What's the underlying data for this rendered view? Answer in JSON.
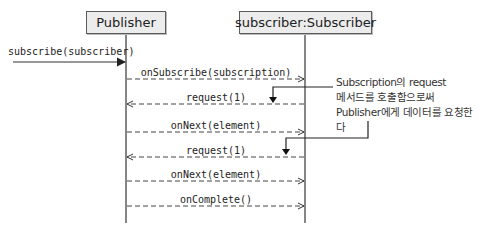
{
  "diagram": {
    "type": "sequence",
    "participants": [
      {
        "name": "Publisher",
        "lifeline_x": 126
      },
      {
        "name": "subscriber:Subscriber",
        "lifeline_x": 305
      }
    ],
    "messages": [
      {
        "label": "subscribe(subscriber)",
        "from": "external",
        "to": "Publisher",
        "style": "solid"
      },
      {
        "label": "onSubscribe(subscription)",
        "from": "Publisher",
        "to": "subscriber:Subscriber",
        "style": "dashed"
      },
      {
        "label": "request(1)",
        "from": "subscriber:Subscriber",
        "to": "Publisher",
        "style": "dashed"
      },
      {
        "label": "onNext(element)",
        "from": "Publisher",
        "to": "subscriber:Subscriber",
        "style": "dashed"
      },
      {
        "label": "request(1)",
        "from": "subscriber:Subscriber",
        "to": "Publisher",
        "style": "dashed"
      },
      {
        "label": "onNext(element)",
        "from": "Publisher",
        "to": "subscriber:Subscriber",
        "style": "dashed"
      },
      {
        "label": "onComplete()",
        "from": "Publisher",
        "to": "subscriber:Subscriber",
        "style": "dashed"
      }
    ],
    "annotation": {
      "lines": [
        "Subscription의 request",
        "메서드를 호출함으로써",
        "Publisher에게 데이터를 요청한다"
      ]
    },
    "colors": {
      "box_fill": "#ececec",
      "box_border": "#5a5a5a",
      "line": "#333333"
    }
  }
}
